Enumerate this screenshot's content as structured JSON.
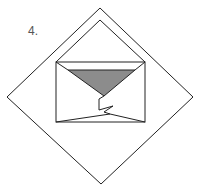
{
  "figure": {
    "number_label": "4.",
    "colors": {
      "stroke": "#222222",
      "fill_triangle": "#8c8c8c",
      "background": "#ffffff"
    }
  }
}
